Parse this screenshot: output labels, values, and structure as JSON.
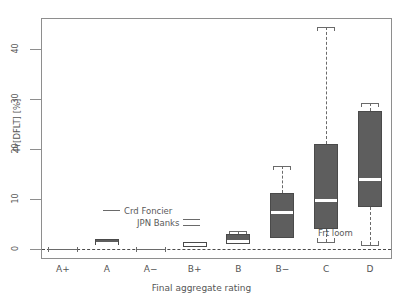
{
  "figure": {
    "title_clipped": "",
    "background": "#ffffff",
    "box_color": "#5e5e5e",
    "median_color": "#ffffff",
    "axis_color": "#8e8e8e"
  },
  "chart_data": {
    "type": "box",
    "title": "",
    "xlabel": "Final aggregate rating",
    "ylabel": "Pr[DFLT] [%]",
    "categories": [
      "A+",
      "A",
      "A−",
      "B+",
      "B",
      "B−",
      "C",
      "D"
    ],
    "ylim": [
      -2,
      46
    ],
    "yticks": [
      0,
      10,
      20,
      30,
      40
    ],
    "ytick_labels": [
      "0",
      "10",
      "20",
      "30",
      "40"
    ],
    "grid": false,
    "zero_reference_line": 0,
    "legend_position": "inside-left-lower",
    "boxes": [
      {
        "category": "A+",
        "whisker_low": 0.1,
        "q1": 0.1,
        "median": 0.1,
        "q3": 0.1,
        "whisker_high": 0.1,
        "style": "flat"
      },
      {
        "category": "A",
        "whisker_low": 0.8,
        "q1": 0.8,
        "median": 1.3,
        "q3": 2.0,
        "whisker_high": 2.0,
        "style": "box"
      },
      {
        "category": "A−",
        "whisker_low": 0.1,
        "q1": 0.1,
        "median": 0.1,
        "q3": 0.1,
        "whisker_high": 0.1,
        "style": "flat"
      },
      {
        "category": "B+",
        "whisker_low": 0.5,
        "q1": 0.5,
        "median": 1.0,
        "q3": 1.5,
        "whisker_high": 1.5,
        "style": "box"
      },
      {
        "category": "B",
        "whisker_low": 1.0,
        "q1": 1.0,
        "median": 1.6,
        "q3": 3.0,
        "whisker_high": 3.6,
        "style": "box"
      },
      {
        "category": "B−",
        "whisker_low": 2.2,
        "q1": 2.2,
        "median": 7.4,
        "q3": 11.2,
        "whisker_high": 16.6,
        "style": "box"
      },
      {
        "category": "C",
        "whisker_low": 1.4,
        "q1": 4.0,
        "median": 9.8,
        "q3": 21.0,
        "whisker_high": 44.4,
        "style": "box"
      },
      {
        "category": "D",
        "whisker_low": 0.8,
        "q1": 8.4,
        "median": 14.0,
        "q3": 27.6,
        "whisker_high": 29.2,
        "style": "box"
      }
    ],
    "legend": [
      {
        "label": "Crd Foncier",
        "marker": "single-line"
      },
      {
        "label": "JPN Banks",
        "marker": "double-line"
      }
    ],
    "annotations": [
      {
        "text": "Frt loom",
        "near_category": "C"
      }
    ]
  }
}
